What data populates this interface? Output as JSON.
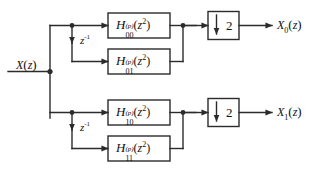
{
  "diagram": {
    "background_color": "#ffffff",
    "line_color": "#2b2b2b",
    "text_color": "#111111",
    "input": {
      "name": "X",
      "arg": "(z)",
      "label": "X(z)"
    },
    "delays": [
      {
        "id": "delay-upper",
        "base": "z",
        "exponent": "-1",
        "label": "z -1"
      },
      {
        "id": "delay-lower",
        "base": "z",
        "exponent": "-1",
        "label": "z -1"
      }
    ],
    "filters": [
      {
        "id": "filter-h00",
        "symbol": "H",
        "superscript": "(p)",
        "subscript": "00",
        "argument_base": "z",
        "argument_power": "2",
        "label": "H(p)00(z2)"
      },
      {
        "id": "filter-h01",
        "symbol": "H",
        "superscript": "(p)",
        "subscript": "01",
        "argument_base": "z",
        "argument_power": "2",
        "label": "H(p)01(z2)"
      },
      {
        "id": "filter-h10",
        "symbol": "H",
        "superscript": "(p)",
        "subscript": "10",
        "argument_base": "z",
        "argument_power": "2",
        "label": "H(p)10(z2)"
      },
      {
        "id": "filter-h11",
        "symbol": "H",
        "superscript": "(p)",
        "subscript": "11",
        "argument_base": "z",
        "argument_power": "2",
        "label": "H(p)11(z2)"
      }
    ],
    "downsamplers": [
      {
        "id": "downsampler-upper",
        "icon": "down-arrow-icon",
        "factor": "2"
      },
      {
        "id": "downsampler-lower",
        "icon": "down-arrow-icon",
        "factor": "2"
      }
    ],
    "outputs": [
      {
        "id": "output-x0",
        "name": "X",
        "subscript": "0",
        "arg": "(z)",
        "label": "X0(z)"
      },
      {
        "id": "output-x1",
        "name": "X",
        "subscript": "1",
        "arg": "(z)",
        "label": "X1(z)"
      }
    ]
  }
}
